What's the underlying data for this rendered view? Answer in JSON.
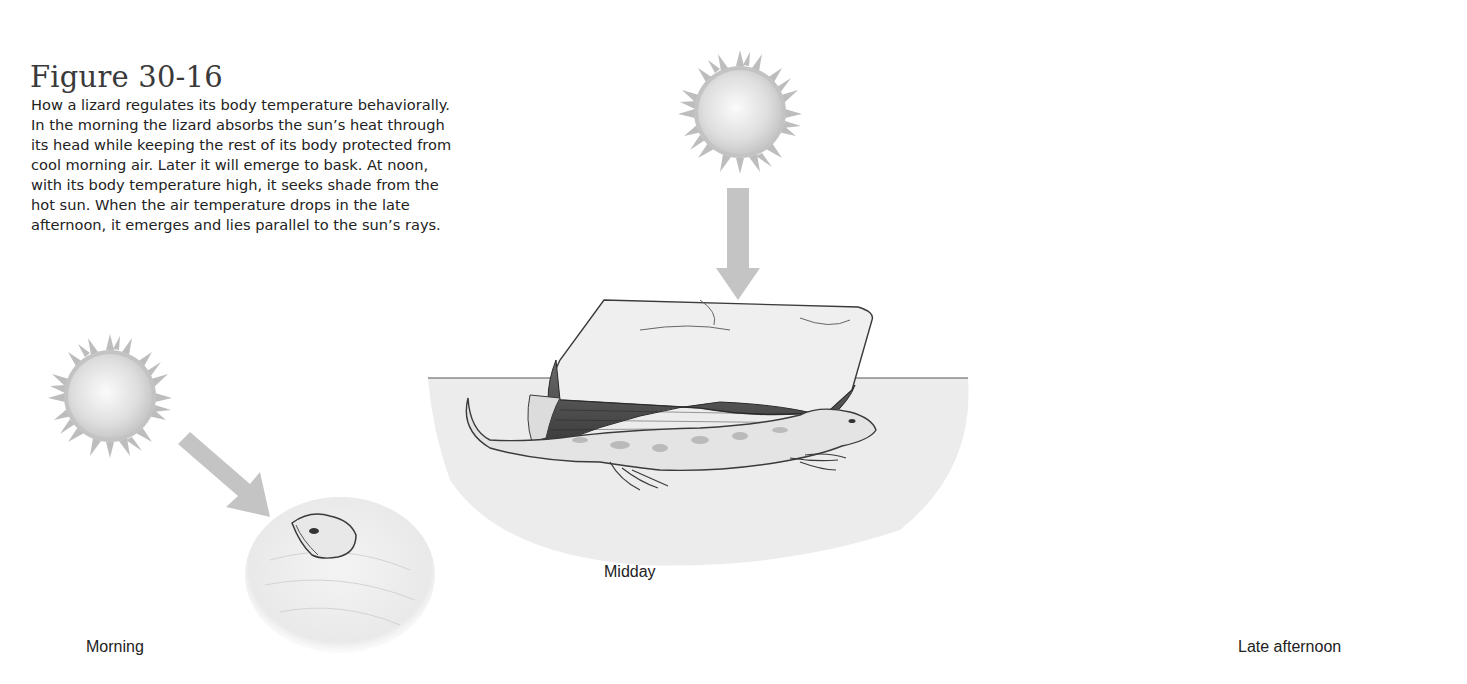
{
  "figure": {
    "title": "Figure 30-16",
    "caption_lines": [
      "How a lizard regulates its body temperature behaviorally.",
      "In the morning the lizard absorbs the sun’s heat through",
      "its head while keeping the rest of its body protected from",
      "cool morning air. Later it will emerge to bask. At noon,",
      "with its body temperature high, it seeks shade from the",
      "hot sun. When the air temperature drops in the late",
      "afternoon, it emerges and lies parallel to the sun’s rays."
    ]
  },
  "scenes": [
    {
      "id": "morning",
      "label": "Morning",
      "sun_icon": "sun-icon",
      "arrow_direction": "down-right",
      "description": "Lizard head emerging from sand"
    },
    {
      "id": "midday",
      "label": "Midday",
      "sun_icon": "sun-icon",
      "arrow_direction": "down",
      "description": "Lizard shading under a rock"
    },
    {
      "id": "late-afternoon",
      "label": "Late afternoon",
      "sun_icon": "sun-icon",
      "arrow_direction": "down-left",
      "description": "Lizard lying parallel to sun's rays"
    }
  ],
  "colors": {
    "arrow": "#c4c4c4",
    "sun_ray": "#b9b9b9",
    "ground": "#ececec",
    "outline": "#3a3a3a",
    "lizard_spots": "#a9a9a9"
  }
}
